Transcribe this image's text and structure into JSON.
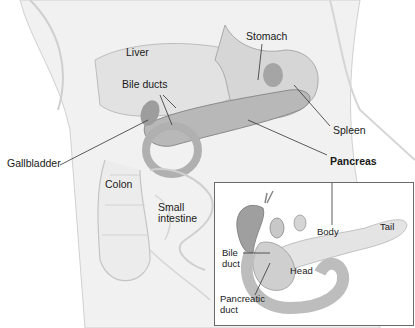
{
  "diagram": {
    "type": "anatomical-illustration",
    "main_labels": {
      "liver": "Liver",
      "stomach": "Stomach",
      "bile_ducts": "Bile ducts",
      "spleen": "Spleen",
      "gallbladder": "Gallbladder",
      "pancreas": "Pancreas",
      "colon": "Colon",
      "small_intestine_line1": "Small",
      "small_intestine_line2": "intestine"
    },
    "inset": {
      "labels": {
        "body": "Body",
        "tail": "Tail",
        "bile_duct_line1": "Bile",
        "bile_duct_line2": "duct",
        "head": "Head",
        "pancreatic_duct_line1": "Pancreatic",
        "pancreatic_duct_line2": "duct"
      }
    },
    "colors": {
      "skin": "#efefef",
      "organ_mid": "#cfcfcf",
      "organ_dark": "#9a9a9a",
      "leader_line": "#333333",
      "inset_border": "#6a6a6a"
    }
  }
}
